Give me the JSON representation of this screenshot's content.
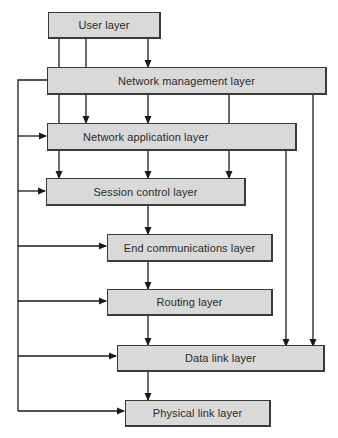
{
  "diagram": {
    "type": "layered-architecture-flow",
    "colors": {
      "box_fill": "#d9d9d9",
      "line": "#1a1a1a",
      "text": "#2a2a2a",
      "background": "#ffffff"
    },
    "layers": [
      {
        "id": "user",
        "label": "User layer"
      },
      {
        "id": "network-management",
        "label": "Network management layer"
      },
      {
        "id": "network-application",
        "label": "Network application layer"
      },
      {
        "id": "session-control",
        "label": "Session control layer"
      },
      {
        "id": "end-communications",
        "label": "End communications layer"
      },
      {
        "id": "routing",
        "label": "Routing layer"
      },
      {
        "id": "data-link",
        "label": "Data link layer"
      },
      {
        "id": "physical-link",
        "label": "Physical link layer"
      }
    ],
    "edges": [
      {
        "from": "user",
        "to": "network-management"
      },
      {
        "from": "user",
        "to": "network-application"
      },
      {
        "from": "user",
        "to": "session-control"
      },
      {
        "from": "network-management",
        "to": "network-application"
      },
      {
        "from": "network-management",
        "to": "session-control"
      },
      {
        "from": "network-management",
        "to": "end-communications"
      },
      {
        "from": "network-management",
        "to": "routing"
      },
      {
        "from": "network-management",
        "to": "data-link"
      },
      {
        "from": "network-management",
        "to": "physical-link"
      },
      {
        "from": "network-management",
        "to": "data-link",
        "via": "right-side"
      },
      {
        "from": "network-application",
        "to": "session-control"
      },
      {
        "from": "network-application",
        "to": "data-link",
        "via": "right-side"
      },
      {
        "from": "session-control",
        "to": "end-communications"
      },
      {
        "from": "end-communications",
        "to": "routing"
      },
      {
        "from": "routing",
        "to": "data-link"
      },
      {
        "from": "data-link",
        "to": "physical-link"
      }
    ]
  }
}
